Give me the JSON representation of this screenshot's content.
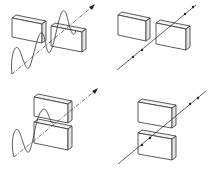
{
  "diagram": {
    "title": "",
    "panels": [
      {
        "id": "top-left",
        "slit": "vertical-gap",
        "beam": "wave",
        "description": "Vertically oscillating wave passing through vertical slit between two side-by-side blocks"
      },
      {
        "id": "top-right",
        "slit": "vertical-gap",
        "beam": "ray-with-dots",
        "description": "Ray with dot markers passing through vertical slit"
      },
      {
        "id": "bottom-left",
        "slit": "horizontal-gap",
        "beam": "wave",
        "description": "Wave passing through horizontal slit between stacked blocks"
      },
      {
        "id": "bottom-right",
        "slit": "horizontal-gap",
        "beam": "ray-with-dots",
        "description": "Ray with dot markers passing through horizontal slit"
      }
    ],
    "colors": {
      "stroke": "#333333",
      "background": "#ffffff"
    }
  }
}
